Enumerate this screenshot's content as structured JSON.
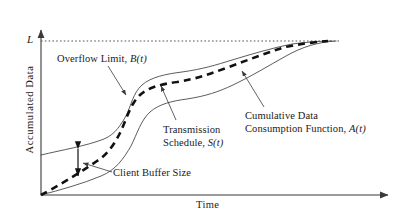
{
  "figure": {
    "type": "line-diagram",
    "background_color": "#ffffff",
    "axes": {
      "y_label": "Accumulated  Data",
      "x_label": "Time",
      "limit_tick_label": "L",
      "axis_color": "#3a3a3a",
      "origin": [
        41,
        195
      ],
      "y_axis_top": [
        41,
        28
      ],
      "x_axis_right": [
        390,
        195
      ],
      "limit_level_y": 41
    },
    "annotations": {
      "overflow_limit": {
        "text_plain": "Overflow Limit, B(t)",
        "text_main": "Overflow Limit, ",
        "symbol": "B(t)",
        "pointer_from": [
          108,
          66
        ],
        "pointer_to": [
          127,
          96
        ]
      },
      "transmission_schedule": {
        "text_plain": "Transmission Schedule, S(t)",
        "line1": "Transmission",
        "line2_main": "Schedule, ",
        "line2_symbol": "S(t)",
        "pointer_from": [
          176,
          120
        ],
        "pointer_to": [
          162,
          87
        ]
      },
      "consumption_function": {
        "text_plain": "Cumulative Data Consumption Function, A(t)",
        "line1": "Cumulative Data",
        "line2_main": "Consumption Function, ",
        "line2_symbol": "A(t)",
        "pointer_from": [
          264,
          108
        ],
        "pointer_to": [
          242,
          72
        ]
      },
      "client_buffer_size": {
        "text_plain": "Client Buffer Size",
        "pointer_from": [
          112,
          172
        ],
        "pointer_to": [
          82,
          163
        ],
        "measure_arrow_x": 78,
        "measure_arrow_top_y": 143,
        "measure_arrow_bottom_y": 181
      }
    },
    "curves": {
      "overflow_limit_B": {
        "name": "Overflow Limit, B(t)",
        "style": "solid",
        "color": "#4a4a4a",
        "width": 0.9,
        "points": [
          [
            41,
            155
          ],
          [
            70,
            148
          ],
          [
            95,
            142
          ],
          [
            112,
            135
          ],
          [
            126,
            118
          ],
          [
            136,
            97
          ],
          [
            146,
            83
          ],
          [
            160,
            76
          ],
          [
            180,
            72
          ],
          [
            205,
            68
          ],
          [
            230,
            61
          ],
          [
            260,
            52
          ],
          [
            290,
            45
          ],
          [
            315,
            42
          ],
          [
            332,
            41
          ]
        ]
      },
      "transmission_schedule_S": {
        "name": "Transmission Schedule, S(t)",
        "style": "dashed",
        "color": "#111111",
        "width": 2.6,
        "dash": "7,5",
        "points": [
          [
            41,
            195
          ],
          [
            62,
            183
          ],
          [
            80,
            172
          ],
          [
            98,
            160
          ],
          [
            112,
            150
          ],
          [
            124,
            132
          ],
          [
            134,
            110
          ],
          [
            145,
            93
          ],
          [
            158,
            86
          ],
          [
            178,
            82
          ],
          [
            200,
            77
          ],
          [
            225,
            68
          ],
          [
            252,
            58
          ],
          [
            280,
            49
          ],
          [
            305,
            44
          ],
          [
            328,
            41
          ]
        ]
      },
      "consumption_function_A": {
        "name": "Cumulative Data Consumption Function, A(t)",
        "style": "solid",
        "color": "#4a4a4a",
        "width": 0.9,
        "points": [
          [
            41,
            195
          ],
          [
            70,
            188
          ],
          [
            92,
            181
          ],
          [
            112,
            172
          ],
          [
            128,
            160
          ],
          [
            140,
            140
          ],
          [
            150,
            120
          ],
          [
            162,
            108
          ],
          [
            178,
            101
          ],
          [
            200,
            96
          ],
          [
            225,
            87
          ],
          [
            252,
            72
          ],
          [
            278,
            58
          ],
          [
            305,
            47
          ],
          [
            325,
            42
          ],
          [
            336,
            41
          ]
        ]
      },
      "limit_line_L": {
        "name": "Overflow limit level L",
        "style": "dotted",
        "color": "#555555",
        "width": 1,
        "points": [
          [
            41,
            41
          ],
          [
            340,
            41
          ]
        ]
      }
    }
  }
}
